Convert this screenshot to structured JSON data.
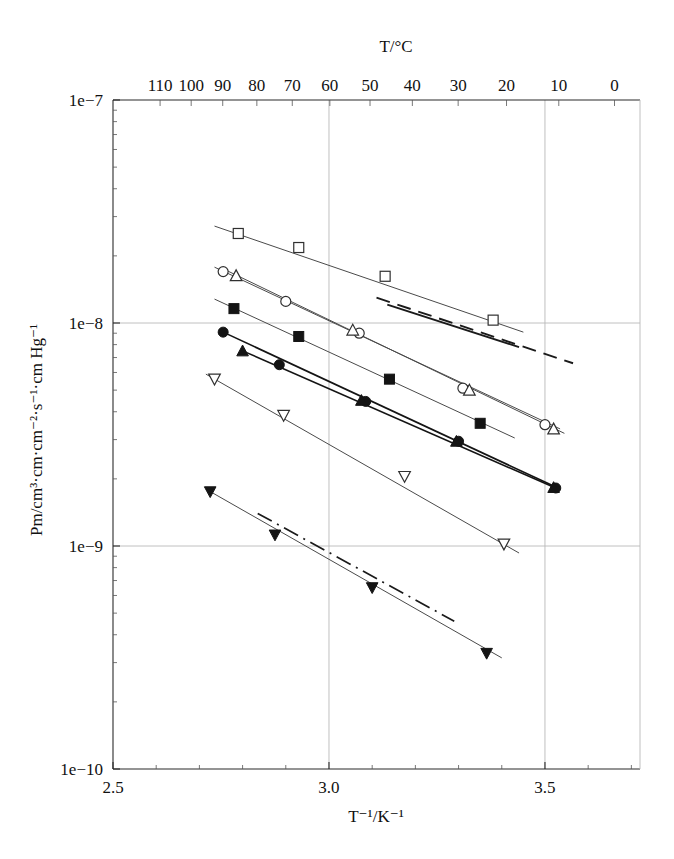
{
  "chart_data": {
    "type": "line",
    "title": "",
    "xlabel": "T⁻¹/K⁻¹",
    "ylabel": "Pm/cm³·cm·cm⁻²·s⁻¹·cm Hg⁻¹",
    "top_axis_label": "T/°C",
    "yscale": "log",
    "xlim": [
      2.5,
      3.72
    ],
    "ylim": [
      1e-10,
      1e-07
    ],
    "grid": true,
    "legend": "none",
    "x_ticks": [
      {
        "value": 2.5,
        "label": "2.5"
      },
      {
        "value": 3.0,
        "label": "3.0"
      },
      {
        "value": 3.5,
        "label": "3.5"
      }
    ],
    "x_minor_ticks": [
      2.6,
      2.7,
      2.8,
      2.9,
      3.1,
      3.2,
      3.3,
      3.4,
      3.6,
      3.7
    ],
    "y_ticks": [
      {
        "value": 1e-07,
        "label": "1e−7"
      },
      {
        "value": 1e-08,
        "label": "1e−8"
      },
      {
        "value": 1e-09,
        "label": "1e−9"
      },
      {
        "value": 1e-10,
        "label": "1e−10"
      }
    ],
    "top_ticks": [
      {
        "celsius": 110,
        "label": "110",
        "x": 2.609
      },
      {
        "celsius": 100,
        "label": "100",
        "x": 2.681
      },
      {
        "celsius": 90,
        "label": "90",
        "x": 2.754
      },
      {
        "celsius": 80,
        "label": "80",
        "x": 2.833
      },
      {
        "celsius": 70,
        "label": "70",
        "x": 2.915
      },
      {
        "celsius": 60,
        "label": "60",
        "x": 3.002
      },
      {
        "celsius": 50,
        "label": "50",
        "x": 3.095
      },
      {
        "celsius": 40,
        "label": "40",
        "x": 3.193
      },
      {
        "celsius": 30,
        "label": "30",
        "x": 3.299
      },
      {
        "celsius": 20,
        "label": "20",
        "x": 3.411
      },
      {
        "celsius": 10,
        "label": "10",
        "x": 3.532
      },
      {
        "celsius": 0,
        "label": "0",
        "x": 3.661
      },
      {
        "celsius": -10,
        "label": "−10",
        "x": 3.8
      },
      {
        "celsius": -20,
        "label": "−20",
        "x": 3.95
      }
    ],
    "series": [
      {
        "name": "open-square",
        "marker": "square-open",
        "line": "solid-thin",
        "points": [
          {
            "x": 2.79,
            "y": 2.52e-08
          },
          {
            "x": 2.93,
            "y": 2.18e-08
          },
          {
            "x": 3.13,
            "y": 1.62e-08
          },
          {
            "x": 3.38,
            "y": 1.03e-08
          }
        ],
        "fit_from": {
          "x": 2.735,
          "y": 2.72e-08
        },
        "fit_to": {
          "x": 3.45,
          "y": 9.1e-09
        }
      },
      {
        "name": "open-circle",
        "marker": "circle-open",
        "line": "solid-thin",
        "points": [
          {
            "x": 2.755,
            "y": 1.7e-08
          },
          {
            "x": 2.9,
            "y": 1.25e-08
          },
          {
            "x": 3.07,
            "y": 9e-09
          },
          {
            "x": 3.31,
            "y": 5.1e-09
          },
          {
            "x": 3.5,
            "y": 3.5e-09
          }
        ],
        "fit_from": {
          "x": 2.735,
          "y": 1.78e-08
        },
        "fit_to": {
          "x": 3.535,
          "y": 3.35e-09
        }
      },
      {
        "name": "open-triangle-up",
        "marker": "triangle-up-open",
        "line": "solid-thin",
        "points": [
          {
            "x": 2.785,
            "y": 1.63e-08
          },
          {
            "x": 3.055,
            "y": 9.3e-09
          },
          {
            "x": 3.325,
            "y": 5e-09
          },
          {
            "x": 3.52,
            "y": 3.35e-09
          }
        ],
        "fit_from": {
          "x": 2.755,
          "y": 1.75e-08
        },
        "fit_to": {
          "x": 3.545,
          "y": 3.2e-09
        }
      },
      {
        "name": "filled-square",
        "marker": "square-filled",
        "line": "solid-thin",
        "points": [
          {
            "x": 2.78,
            "y": 1.16e-08
          },
          {
            "x": 2.93,
            "y": 8.7e-09
          },
          {
            "x": 3.14,
            "y": 5.6e-09
          },
          {
            "x": 3.35,
            "y": 3.55e-09
          }
        ],
        "fit_from": {
          "x": 2.735,
          "y": 1.28e-08
        },
        "fit_to": {
          "x": 3.43,
          "y": 3.05e-09
        }
      },
      {
        "name": "filled-circle",
        "marker": "circle-filled",
        "line": "solid-dark",
        "points": [
          {
            "x": 2.755,
            "y": 9.1e-09
          },
          {
            "x": 2.885,
            "y": 6.5e-09
          },
          {
            "x": 3.085,
            "y": 4.45e-09
          },
          {
            "x": 3.3,
            "y": 2.95e-09
          },
          {
            "x": 3.525,
            "y": 1.82e-09
          }
        ],
        "fit_from": {
          "x": 2.755,
          "y": 9.1e-09
        },
        "fit_to": {
          "x": 3.535,
          "y": 1.8e-09
        }
      },
      {
        "name": "filled-triangle-up",
        "marker": "triangle-up-filled",
        "line": "solid-dark",
        "points": [
          {
            "x": 2.8,
            "y": 7.5e-09
          },
          {
            "x": 3.075,
            "y": 4.5e-09
          },
          {
            "x": 3.295,
            "y": 2.95e-09
          },
          {
            "x": 3.52,
            "y": 1.83e-09
          }
        ],
        "fit_from": {
          "x": 2.8,
          "y": 7.5e-09
        },
        "fit_to": {
          "x": 3.53,
          "y": 1.8e-09
        }
      },
      {
        "name": "open-triangle-down",
        "marker": "triangle-down-open",
        "line": "solid-thin",
        "points": [
          {
            "x": 2.735,
            "y": 5.6e-09
          },
          {
            "x": 2.895,
            "y": 3.85e-09
          },
          {
            "x": 3.175,
            "y": 2.05e-09
          },
          {
            "x": 3.405,
            "y": 1.02e-09
          }
        ],
        "fit_from": {
          "x": 2.715,
          "y": 5.9e-09
        },
        "fit_to": {
          "x": 3.44,
          "y": 9.3e-10
        }
      },
      {
        "name": "filled-triangle-down",
        "marker": "triangle-down-filled",
        "line": "solid-thin",
        "points": [
          {
            "x": 2.725,
            "y": 1.75e-09
          },
          {
            "x": 2.875,
            "y": 1.12e-09
          },
          {
            "x": 3.1,
            "y": 6.5e-10
          },
          {
            "x": 3.365,
            "y": 3.3e-10
          }
        ],
        "fit_from": {
          "x": 2.715,
          "y": 1.8e-09
        },
        "fit_to": {
          "x": 3.4,
          "y": 3.15e-10
        }
      }
    ],
    "reference_lines": [
      {
        "name": "dashed-reference",
        "style": "dashed",
        "from": {
          "x": 3.11,
          "y": 1.3e-08
        },
        "to": {
          "x": 3.565,
          "y": 6.6e-09
        }
      },
      {
        "name": "solid-reference",
        "style": "solid-thick",
        "from": {
          "x": 3.135,
          "y": 1.21e-08
        },
        "to": {
          "x": 3.44,
          "y": 7.8e-09
        }
      },
      {
        "name": "dashdot-reference",
        "style": "dash-dot",
        "from": {
          "x": 2.835,
          "y": 1.4e-09
        },
        "to": {
          "x": 3.29,
          "y": 4.6e-10
        }
      }
    ]
  },
  "axes": {
    "top_title": "T/°C",
    "bottom_title": "T⁻¹/K⁻¹",
    "left_title": "Pm/cm³·cm·cm⁻²·s⁻¹·cm Hg⁻¹",
    "y_labels": [
      "1e−7",
      "1e−8",
      "1e−9",
      "1e−10"
    ],
    "x_labels": [
      "2.5",
      "3.0",
      "3.5"
    ],
    "top_labels": [
      "110",
      "100",
      "90",
      "80",
      "70",
      "60",
      "50",
      "40",
      "30",
      "20",
      "10",
      "0",
      "−10",
      "−20"
    ]
  }
}
